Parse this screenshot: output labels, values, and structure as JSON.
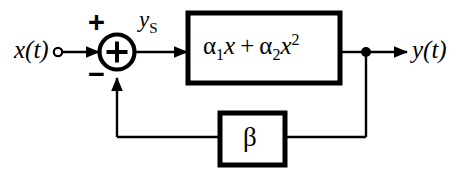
{
  "diagram": {
    "type": "control-block-diagram",
    "background_color": "#ffffff",
    "line_color": "#000000"
  },
  "signals": {
    "input_label": "x(t)",
    "output_label": "y(t)",
    "summer_output_label_base": "y",
    "summer_output_label_sub": "S"
  },
  "summing_junction": {
    "symbol": "+",
    "positive_sign": "+",
    "negative_sign": "−",
    "center_x": 117,
    "center_y": 52,
    "radius": 18
  },
  "forward_block": {
    "name": "nonlinearity",
    "alpha_symbol": "α",
    "term1_coefficient": "α",
    "term1_subscript": "1",
    "term1_variable": "x",
    "operator": "+",
    "term2_coefficient": "α",
    "term2_subscript": "2",
    "term2_variable": "x",
    "term2_exponent": "2",
    "equation_plain": "α1x + α2x²"
  },
  "feedback_block": {
    "name": "feedback-gain",
    "label": "β"
  }
}
